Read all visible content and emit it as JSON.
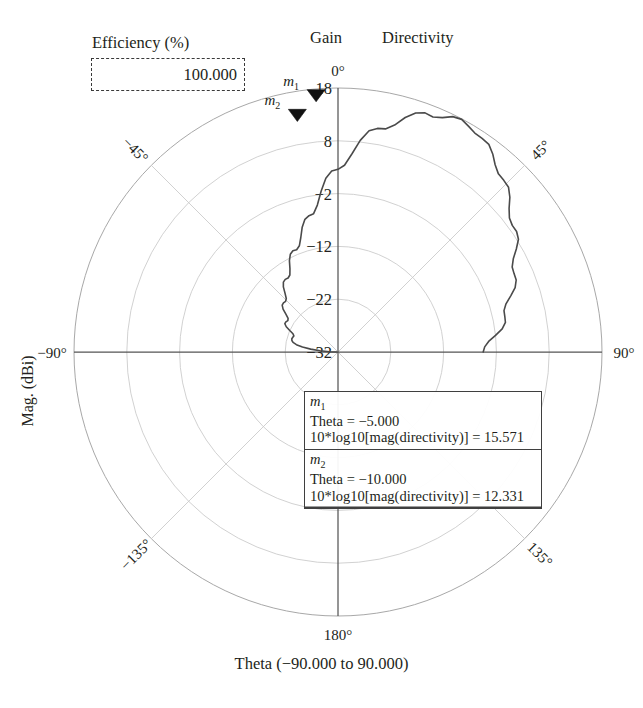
{
  "header": {
    "efficiency_title": "Efficiency (%)",
    "efficiency_value": "100.000",
    "gain_label": "Gain",
    "directivity_label": "Directivity"
  },
  "axes": {
    "ylabel": "Mag. (dBi)",
    "xlabel": "Theta (−90.000 to 90.000)"
  },
  "markers": [
    {
      "name": "m",
      "index": "1",
      "theta_line": "Theta = −5.000",
      "value_line": "10*log10[mag(directivity)] = 15.571",
      "theta": -5.0,
      "value": 15.571
    },
    {
      "name": "m",
      "index": "2",
      "theta_line": "Theta = −10.000",
      "value_line": "10*log10[mag(directivity)] = 12.331",
      "theta": -10.0,
      "value": 12.331
    }
  ],
  "chart_data": {
    "type": "line",
    "plot_style": "polar",
    "title": "",
    "xlabel": "Theta (−90.000 to 90.000)",
    "ylabel": "Mag. (dBi)",
    "legend": [
      "Gain",
      "Directivity"
    ],
    "legend_position": "top",
    "grid": true,
    "angle_unit": "degrees",
    "angle_ticks": [
      {
        "value": 0,
        "label": "0°"
      },
      {
        "value": 45,
        "label": "45°"
      },
      {
        "value": 90,
        "label": "90°"
      },
      {
        "value": 135,
        "label": "135°"
      },
      {
        "value": 180,
        "label": "180°"
      },
      {
        "value": -135,
        "label": "−135°"
      },
      {
        "value": -90,
        "label": "−90°"
      },
      {
        "value": -45,
        "label": "−45°"
      }
    ],
    "radial_ticks": [
      {
        "value": 18,
        "label": "18"
      },
      {
        "value": 8,
        "label": "8"
      },
      {
        "value": -2,
        "label": "−2"
      },
      {
        "value": -12,
        "label": "−12"
      },
      {
        "value": -22,
        "label": "−22"
      },
      {
        "value": -32,
        "label": "−32"
      }
    ],
    "rlim": [
      -32,
      18
    ],
    "rcenter": -32,
    "router": 18,
    "theta_range": [
      -90,
      90
    ],
    "series": [
      {
        "name": "Directivity",
        "theta": [
          -90,
          -88,
          -86,
          -84,
          -82,
          -80,
          -78,
          -76,
          -74,
          -72,
          -70,
          -68,
          -66,
          -64,
          -62,
          -60,
          -58,
          -56,
          -54,
          -52,
          -50,
          -48,
          -46,
          -44,
          -42,
          -40,
          -38,
          -36,
          -34,
          -32,
          -30,
          -28,
          -26,
          -24,
          -22,
          -20,
          -18,
          -16,
          -14,
          -12,
          -10,
          -8,
          -6,
          -4,
          -2,
          0,
          2,
          4,
          6,
          8,
          10,
          12,
          14,
          16,
          18,
          20,
          22,
          24,
          26,
          28,
          30,
          32,
          34,
          36,
          38,
          40,
          42,
          44,
          46,
          48,
          50,
          52,
          54,
          56,
          58,
          60,
          62,
          64,
          66,
          68,
          70,
          72,
          74,
          76,
          78,
          80,
          82,
          84,
          86,
          88,
          90
        ],
        "values": [
          -32.0,
          -30.4,
          -28.6,
          -26.8,
          -25.2,
          -24.0,
          -23.3,
          -23.0,
          -22.9,
          -23.0,
          -23.1,
          -22.8,
          -22.0,
          -21.1,
          -20.6,
          -20.6,
          -20.8,
          -20.6,
          -19.8,
          -18.8,
          -18.2,
          -18.1,
          -18.2,
          -17.9,
          -17.0,
          -15.9,
          -15.2,
          -15.0,
          -15.1,
          -14.8,
          -13.8,
          -12.4,
          -11.4,
          -11.0,
          -11.1,
          -10.6,
          -9.2,
          -7.4,
          -6.1,
          -5.6,
          -5.4,
          -3.9,
          -1.4,
          1.0,
          2.3,
          2.6,
          3.4,
          5.6,
          8.3,
          10.3,
          11.0,
          11.2,
          12.3,
          14.2,
          15.6,
          16.2,
          16.0,
          16.6,
          17.6,
          17.9,
          17.4,
          16.9,
          16.8,
          16.6,
          15.6,
          14.3,
          13.4,
          13.2,
          12.9,
          11.8,
          10.3,
          9.2,
          8.8,
          8.8,
          8.3,
          7.0,
          5.6,
          4.7,
          4.5,
          4.4,
          3.7,
          2.4,
          1.1,
          0.4,
          0.3,
          0.2,
          -0.6,
          -2.0,
          -3.4,
          -4.2,
          -4.5
        ]
      }
    ],
    "annotations": [
      {
        "label": "m1",
        "theta": -5.0,
        "value": 15.571
      },
      {
        "label": "m2",
        "theta": -10.0,
        "value": 12.331
      }
    ]
  },
  "geometry": {
    "cx": 338,
    "cy": 352,
    "router_px": 264
  }
}
